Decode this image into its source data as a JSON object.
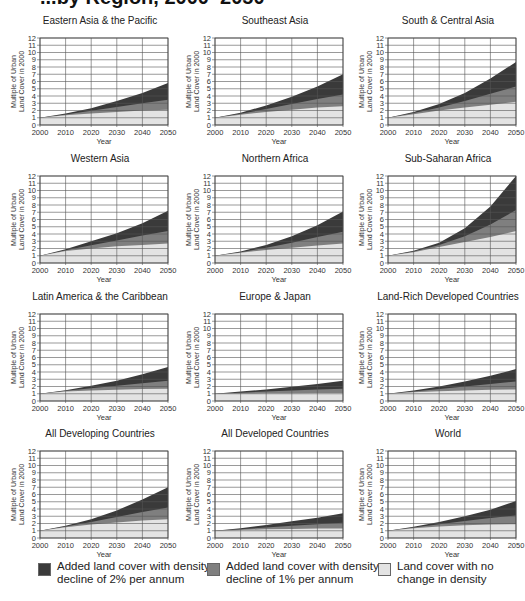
{
  "page": {
    "title_fragment": "...by Region, 2000–2050"
  },
  "legend": [
    {
      "label_line1": "Added land cover with density",
      "label_line2": "decline of 2% per annum",
      "color": "#3a3a3a"
    },
    {
      "label_line1": "Added land cover with density",
      "label_line2": "decline of 1% per annum",
      "color": "#7f7f7f"
    },
    {
      "label_line1": "Land cover with no",
      "label_line2": "change in density",
      "color": "#e3e3e3"
    }
  ],
  "chart_data": [
    {
      "type": "area",
      "title": "Eastern Asia & the Pacific",
      "xlabel": "Year",
      "ylabel": "Multiple of Urban Land Cover in 2000",
      "x": [
        2000,
        2010,
        2020,
        2030,
        2040,
        2050
      ],
      "ylim": [
        0,
        12
      ],
      "series": [
        {
          "name": "Land cover with no change in density",
          "values": [
            1,
            1.35,
            1.6,
            1.8,
            2.0,
            2.1
          ]
        },
        {
          "name": "Added land cover with density decline of 1% per annum (cumulative top)",
          "values": [
            1,
            1.45,
            1.95,
            2.5,
            3.0,
            3.5
          ]
        },
        {
          "name": "Added land cover with density decline of 2% per annum (cumulative top)",
          "values": [
            1,
            1.6,
            2.3,
            3.3,
            4.4,
            5.8
          ]
        }
      ]
    },
    {
      "type": "area",
      "title": "Southeast Asia",
      "xlabel": "Year",
      "ylabel": "Multiple of Urban Land Cover in 2000",
      "x": [
        2000,
        2010,
        2020,
        2030,
        2040,
        2050
      ],
      "ylim": [
        0,
        12
      ],
      "series": [
        {
          "name": "Land cover with no change in density",
          "values": [
            1,
            1.4,
            1.8,
            2.1,
            2.4,
            2.6
          ]
        },
        {
          "name": "Added land cover with density decline of 1% per annum (cumulative top)",
          "values": [
            1,
            1.55,
            2.2,
            2.9,
            3.6,
            4.2
          ]
        },
        {
          "name": "Added land cover with density decline of 2% per annum (cumulative top)",
          "values": [
            1,
            1.7,
            2.7,
            3.9,
            5.3,
            7.0
          ]
        }
      ]
    },
    {
      "type": "area",
      "title": "South & Central Asia",
      "xlabel": "Year",
      "ylabel": "Multiple of Urban Land Cover in 2000",
      "x": [
        2000,
        2010,
        2020,
        2030,
        2040,
        2050
      ],
      "ylim": [
        0,
        12
      ],
      "series": [
        {
          "name": "Land cover with no change in density",
          "values": [
            1,
            1.5,
            2.0,
            2.4,
            2.8,
            3.2
          ]
        },
        {
          "name": "Added land cover with density decline of 1% per annum (cumulative top)",
          "values": [
            1,
            1.65,
            2.4,
            3.3,
            4.3,
            5.3
          ]
        },
        {
          "name": "Added land cover with density decline of 2% per annum (cumulative top)",
          "values": [
            1,
            1.8,
            2.9,
            4.4,
            6.4,
            8.7
          ]
        }
      ]
    },
    {
      "type": "area",
      "title": "Western Asia",
      "xlabel": "Year",
      "ylabel": "Multiple of Urban Land Cover in 2000",
      "x": [
        2000,
        2010,
        2020,
        2030,
        2040,
        2050
      ],
      "ylim": [
        0,
        12
      ],
      "series": [
        {
          "name": "Land cover with no change in density",
          "values": [
            1,
            1.65,
            2.0,
            2.3,
            2.5,
            2.7
          ]
        },
        {
          "name": "Added land cover with density decline of 1% per annum (cumulative top)",
          "values": [
            1,
            1.75,
            2.45,
            3.1,
            3.8,
            4.4
          ]
        },
        {
          "name": "Added land cover with density decline of 2% per annum (cumulative top)",
          "values": [
            1,
            1.9,
            3.0,
            4.1,
            5.5,
            7.2
          ]
        }
      ]
    },
    {
      "type": "area",
      "title": "Northern Africa",
      "xlabel": "Year",
      "ylabel": "Multiple of Urban Land Cover in 2000",
      "x": [
        2000,
        2010,
        2020,
        2030,
        2040,
        2050
      ],
      "ylim": [
        0,
        12
      ],
      "series": [
        {
          "name": "Land cover with no change in density",
          "values": [
            1,
            1.4,
            1.8,
            2.1,
            2.4,
            2.7
          ]
        },
        {
          "name": "Added land cover with density decline of 1% per annum (cumulative top)",
          "values": [
            1,
            1.5,
            2.1,
            2.8,
            3.6,
            4.3
          ]
        },
        {
          "name": "Added land cover with density decline of 2% per annum (cumulative top)",
          "values": [
            1,
            1.6,
            2.5,
            3.7,
            5.2,
            7.1
          ]
        }
      ]
    },
    {
      "type": "area",
      "title": "Sub-Saharan Africa",
      "xlabel": "Year",
      "ylabel": "Multiple of Urban Land Cover in 2000",
      "x": [
        2000,
        2010,
        2020,
        2030,
        2040,
        2050
      ],
      "ylim": [
        0,
        12
      ],
      "series": [
        {
          "name": "Land cover with no change in density",
          "values": [
            1,
            1.5,
            2.2,
            2.9,
            3.6,
            4.4
          ]
        },
        {
          "name": "Added land cover with density decline of 1% per annum (cumulative top)",
          "values": [
            1,
            1.6,
            2.5,
            3.7,
            5.3,
            7.3
          ]
        },
        {
          "name": "Added land cover with density decline of 2% per annum (cumulative top)",
          "values": [
            1,
            1.7,
            2.8,
            4.8,
            7.8,
            12.0
          ]
        }
      ]
    },
    {
      "type": "area",
      "title": "Latin America & the Caribbean",
      "xlabel": "Year",
      "ylabel": "Multiple of Urban Land Cover in 2000",
      "x": [
        2000,
        2010,
        2020,
        2030,
        2040,
        2050
      ],
      "ylim": [
        0,
        12
      ],
      "series": [
        {
          "name": "Land cover with no change in density",
          "values": [
            1,
            1.3,
            1.45,
            1.55,
            1.65,
            1.7
          ]
        },
        {
          "name": "Added land cover with density decline of 1% per annum (cumulative top)",
          "values": [
            1,
            1.4,
            1.75,
            2.1,
            2.45,
            2.8
          ]
        },
        {
          "name": "Added land cover with density decline of 2% per annum (cumulative top)",
          "values": [
            1,
            1.5,
            2.1,
            2.8,
            3.7,
            4.7
          ]
        }
      ]
    },
    {
      "type": "area",
      "title": "Europe & Japan",
      "xlabel": "Year",
      "ylabel": "Multiple of Urban Land Cover in 2000",
      "x": [
        2000,
        2010,
        2020,
        2030,
        2040,
        2050
      ],
      "ylim": [
        0,
        12
      ],
      "series": [
        {
          "name": "Land cover with no change in density",
          "values": [
            1,
            1.03,
            1.06,
            1.08,
            1.1,
            1.1
          ]
        },
        {
          "name": "Added land cover with density decline of 1% per annum (cumulative top)",
          "values": [
            1,
            1.15,
            1.3,
            1.45,
            1.6,
            1.7
          ]
        },
        {
          "name": "Added land cover with density decline of 2% per annum (cumulative top)",
          "values": [
            1,
            1.3,
            1.6,
            1.95,
            2.35,
            2.8
          ]
        }
      ]
    },
    {
      "type": "area",
      "title": "Land-Rich Developed Countries",
      "xlabel": "Year",
      "ylabel": "Multiple of Urban Land Cover in 2000",
      "x": [
        2000,
        2010,
        2020,
        2030,
        2040,
        2050
      ],
      "ylim": [
        0,
        12
      ],
      "series": [
        {
          "name": "Land cover with no change in density",
          "values": [
            1,
            1.2,
            1.35,
            1.45,
            1.55,
            1.6
          ]
        },
        {
          "name": "Added land cover with density decline of 1% per annum (cumulative top)",
          "values": [
            1,
            1.3,
            1.65,
            2.0,
            2.35,
            2.7
          ]
        },
        {
          "name": "Added land cover with density decline of 2% per annum (cumulative top)",
          "values": [
            1,
            1.45,
            2.0,
            2.7,
            3.5,
            4.4
          ]
        }
      ]
    },
    {
      "type": "area",
      "title": "All Developing Countries",
      "xlabel": "Year",
      "ylabel": "Multiple of Urban Land Cover in 2000",
      "x": [
        2000,
        2010,
        2020,
        2030,
        2040,
        2050
      ],
      "ylim": [
        0,
        12
      ],
      "series": [
        {
          "name": "Land cover with no change in density",
          "values": [
            1,
            1.5,
            1.85,
            2.15,
            2.4,
            2.6
          ]
        },
        {
          "name": "Added land cover with density decline of 1% per annum (cumulative top)",
          "values": [
            1,
            1.6,
            2.2,
            2.9,
            3.6,
            4.2
          ]
        },
        {
          "name": "Added land cover with density decline of 2% per annum (cumulative top)",
          "values": [
            1,
            1.7,
            2.6,
            3.8,
            5.3,
            7.0
          ]
        }
      ]
    },
    {
      "type": "area",
      "title": "All Developed Countries",
      "xlabel": "Year",
      "ylabel": "Multiple of Urban Land Cover in 2000",
      "x": [
        2000,
        2010,
        2020,
        2030,
        2040,
        2050
      ],
      "ylim": [
        0,
        12
      ],
      "series": [
        {
          "name": "Land cover with no change in density",
          "values": [
            1,
            1.1,
            1.2,
            1.25,
            1.3,
            1.3
          ]
        },
        {
          "name": "Added land cover with density decline of 1% per annum (cumulative top)",
          "values": [
            1,
            1.2,
            1.45,
            1.7,
            1.9,
            2.1
          ]
        },
        {
          "name": "Added land cover with density decline of 2% per annum (cumulative top)",
          "values": [
            1,
            1.35,
            1.8,
            2.3,
            2.8,
            3.4
          ]
        }
      ]
    },
    {
      "type": "area",
      "title": "World",
      "xlabel": "Year",
      "ylabel": "Multiple of Urban Land Cover in 2000",
      "x": [
        2000,
        2010,
        2020,
        2030,
        2040,
        2050
      ],
      "ylim": [
        0,
        12
      ],
      "series": [
        {
          "name": "Land cover with no change in density",
          "values": [
            1,
            1.35,
            1.6,
            1.75,
            1.85,
            1.9
          ]
        },
        {
          "name": "Added land cover with density decline of 1% per annum (cumulative top)",
          "values": [
            1,
            1.45,
            1.9,
            2.35,
            2.75,
            3.1
          ]
        },
        {
          "name": "Added land cover with density decline of 2% per annum (cumulative top)",
          "values": [
            1,
            1.55,
            2.2,
            3.0,
            3.9,
            5.1
          ]
        }
      ]
    }
  ],
  "axis": {
    "yticks": [
      "0",
      "1",
      "2",
      "3",
      "4",
      "5",
      "6",
      "7",
      "8",
      "9",
      "10",
      "11",
      "12"
    ],
    "xticks": [
      "2000",
      "2010",
      "2020",
      "2030",
      "2040",
      "2050"
    ],
    "ylabel_line1": "Multiple of Urban",
    "ylabel_line2": "Land Cover in 2000",
    "xlabel": "Year"
  },
  "colors": {
    "dark": "#3a3a3a",
    "medium": "#7f7f7f",
    "light": "#e3e3e3",
    "grid": "#555555"
  }
}
